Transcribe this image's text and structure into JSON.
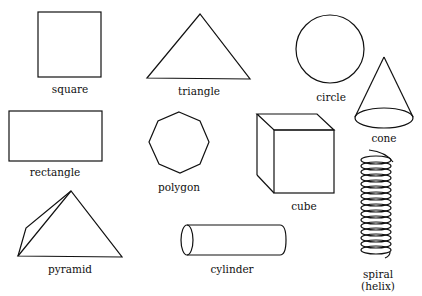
{
  "shapes": {
    "square": {
      "label": "square"
    },
    "triangle": {
      "label": "triangle"
    },
    "circle": {
      "label": "circle"
    },
    "cone": {
      "label": "cone"
    },
    "rectangle": {
      "label": "rectangle"
    },
    "polygon": {
      "label": "polygon"
    },
    "cube": {
      "label": "cube"
    },
    "pyramid": {
      "label": "pyramid"
    },
    "cylinder": {
      "label": "cylinder"
    },
    "spiral": {
      "label": "spiral",
      "label2": "(helix)"
    }
  },
  "colors": {
    "stroke": "#111111",
    "background": "#ffffff"
  }
}
